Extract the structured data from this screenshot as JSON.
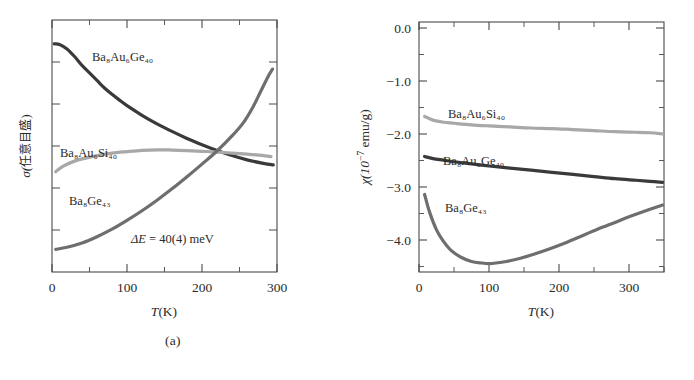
{
  "figure": {
    "caption_a": "(a)",
    "caption_b": "(b)"
  },
  "panel_a": {
    "xlabel_var": "T",
    "xlabel_unit": "(K)",
    "ylabel_sigma": "σ(",
    "ylabel_jp": "任意目盛",
    "ylabel_close": ")",
    "xticks": [
      "0",
      "100",
      "200",
      "300"
    ],
    "annotation": "ΔE = 40(4) meV",
    "labels": {
      "auge": "Ba₈Au₆Ge₄₀",
      "ausi": "Ba₈Au₆Si₄₀",
      "ge43": "Ba₈Ge₄₃"
    }
  },
  "panel_b": {
    "xlabel_var": "T",
    "xlabel_unit": "(K)",
    "ylabel_chi": "χ(10",
    "ylabel_exp": "−7",
    "ylabel_unit": " emu/g)",
    "xticks": [
      "0",
      "100",
      "200",
      "300"
    ],
    "yticks": [
      "0.0",
      "−1.0",
      "−2.0",
      "−3.0",
      "−4.0"
    ],
    "labels": {
      "ausi": "Ba₈Au₆Si₄₀",
      "auge": "Ba₈Au₆Ge₄₀",
      "ge43": "Ba₈Ge₄₃"
    }
  },
  "colors": {
    "dark": "#3a3a3a",
    "medium": "#6e6e6e",
    "light": "#a8a8a8",
    "axis": "#4a4a4a",
    "text": "#2b2b2b"
  },
  "chart_data": [
    {
      "type": "line",
      "panel": "a",
      "title": "",
      "xlabel": "T(K)",
      "ylabel": "σ(任意目盛)",
      "xlim": [
        0,
        300
      ],
      "ylim": [
        0,
        1
      ],
      "xticks": [
        0,
        100,
        200,
        300
      ],
      "xminor_step": 50,
      "yticks_labeled": false,
      "yminor_count": 6,
      "grid": false,
      "legend": "inline-annotations",
      "annotations": [
        {
          "text": "ΔE = 40(4) meV",
          "x": 150,
          "y": 0.14
        }
      ],
      "series": [
        {
          "name": "Ba₈Au₆Ge₄₀",
          "color": "#3a3a3a",
          "x": [
            3,
            10,
            20,
            30,
            40,
            50,
            60,
            70,
            80,
            90,
            100,
            120,
            140,
            160,
            180,
            200,
            220,
            240,
            260,
            280,
            295
          ],
          "y": [
            0.905,
            0.903,
            0.885,
            0.855,
            0.82,
            0.79,
            0.76,
            0.73,
            0.705,
            0.682,
            0.66,
            0.622,
            0.588,
            0.558,
            0.53,
            0.505,
            0.482,
            0.462,
            0.445,
            0.432,
            0.425
          ]
        },
        {
          "name": "Ba₈Au₆Si₄₀",
          "color": "#a8a8a8",
          "x": [
            5,
            15,
            30,
            45,
            60,
            80,
            100,
            120,
            140,
            160,
            180,
            200,
            220,
            240,
            260,
            280,
            292
          ],
          "y": [
            0.398,
            0.42,
            0.44,
            0.452,
            0.462,
            0.472,
            0.478,
            0.483,
            0.485,
            0.484,
            0.482,
            0.479,
            0.476,
            0.472,
            0.468,
            0.463,
            0.458
          ]
        },
        {
          "name": "Ba₈Ge₄₃",
          "color": "#6e6e6e",
          "x": [
            5,
            20,
            40,
            60,
            80,
            100,
            120,
            140,
            160,
            180,
            200,
            220,
            240,
            255,
            268,
            278,
            288,
            294
          ],
          "y": [
            0.09,
            0.098,
            0.115,
            0.14,
            0.17,
            0.205,
            0.243,
            0.285,
            0.33,
            0.378,
            0.428,
            0.48,
            0.54,
            0.592,
            0.655,
            0.715,
            0.775,
            0.805
          ]
        }
      ]
    },
    {
      "type": "line",
      "panel": "b",
      "title": "",
      "xlabel": "T(K)",
      "ylabel": "χ(10⁻⁷ emu/g)",
      "xlim": [
        0,
        350
      ],
      "ylim": [
        -4.62,
        0.12
      ],
      "xticks": [
        0,
        100,
        200,
        300
      ],
      "xminor_step": 50,
      "yticks": [
        0.0,
        -1.0,
        -2.0,
        -3.0,
        -4.0
      ],
      "yminor_step": 0.5,
      "grid": false,
      "legend": "inline-annotations",
      "series": [
        {
          "name": "Ba₈Au₆Si₄₀",
          "color": "#a8a8a8",
          "x": [
            8,
            20,
            35,
            50,
            75,
            100,
            130,
            160,
            190,
            220,
            250,
            280,
            310,
            330,
            348
          ],
          "y": [
            -1.67,
            -1.74,
            -1.78,
            -1.8,
            -1.83,
            -1.85,
            -1.87,
            -1.89,
            -1.9,
            -1.92,
            -1.94,
            -1.96,
            -1.97,
            -1.98,
            -2.0
          ]
        },
        {
          "name": "Ba₈Au₆Ge₄₀",
          "color": "#3a3a3a",
          "x": [
            8,
            20,
            35,
            50,
            75,
            100,
            130,
            160,
            190,
            220,
            250,
            280,
            310,
            330,
            348
          ],
          "y": [
            -2.43,
            -2.47,
            -2.5,
            -2.53,
            -2.57,
            -2.61,
            -2.65,
            -2.69,
            -2.73,
            -2.77,
            -2.81,
            -2.85,
            -2.88,
            -2.9,
            -2.92
          ]
        },
        {
          "name": "Ba₈Ge₄₃",
          "color": "#6e6e6e",
          "x": [
            8,
            15,
            25,
            35,
            45,
            60,
            75,
            90,
            100,
            110,
            125,
            145,
            165,
            185,
            205,
            230,
            255,
            280,
            305,
            330,
            348
          ],
          "y": [
            -3.15,
            -3.48,
            -3.82,
            -4.04,
            -4.2,
            -4.34,
            -4.42,
            -4.45,
            -4.46,
            -4.45,
            -4.42,
            -4.36,
            -4.28,
            -4.19,
            -4.09,
            -3.95,
            -3.81,
            -3.68,
            -3.55,
            -3.43,
            -3.35
          ]
        }
      ]
    }
  ]
}
